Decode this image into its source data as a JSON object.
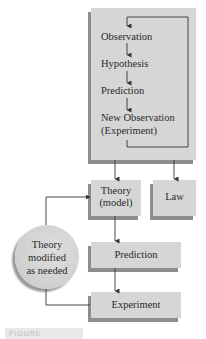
{
  "diagram": {
    "process_box": {
      "steps": [
        "Observation",
        "Hypothesis",
        "Prediction",
        "New Observation",
        "(Experiment)"
      ]
    },
    "theory_box": {
      "line1": "Theory",
      "line2": "(model)"
    },
    "law_box": {
      "label": "Law"
    },
    "modify_circle": {
      "line1": "Theory",
      "line2": "modified",
      "line3": "as needed"
    },
    "prediction_box": {
      "label": "Prediction"
    },
    "experiment_box": {
      "label": "Experiment"
    },
    "figure_label": {
      "text": "FIGURE"
    },
    "colors": {
      "box_fill": "#d6d6d6",
      "box_shadow": "#8d8d8d",
      "line": "#333333",
      "text": "#2a2a2a"
    }
  }
}
